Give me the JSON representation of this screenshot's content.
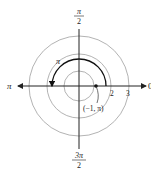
{
  "diagram": {
    "type": "polar-coordinate-plot",
    "circle_radii": [
      1,
      2,
      3
    ],
    "axis_labels": {
      "right": "0",
      "left": "π",
      "top": {
        "numerator": "π",
        "denominator": "2"
      },
      "bottom": {
        "numerator": "3π",
        "denominator": "2"
      }
    },
    "radius_tick_labels": [
      "2",
      "3"
    ],
    "arc": {
      "label": "π",
      "radius": 1.7,
      "start_angle_deg": 0,
      "end_angle_deg": 180,
      "direction": "counterclockwise"
    },
    "point": {
      "label": "(−1, π)",
      "r": -1,
      "theta": "π"
    },
    "colors": {
      "axis": "#222222",
      "grid_circle": "#9a9a9a",
      "arc": "#111111"
    }
  }
}
